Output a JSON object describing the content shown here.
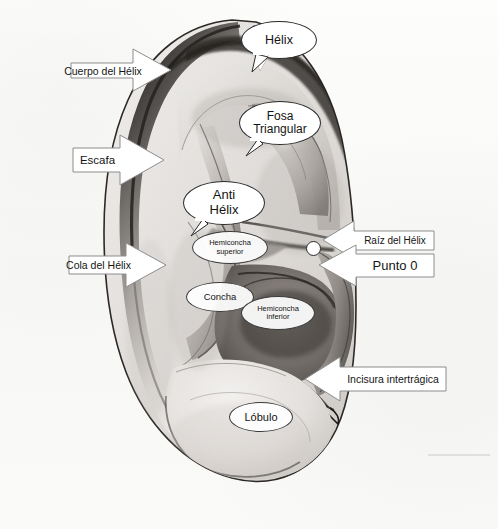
{
  "figure": {
    "background_color": "#fbfbfa",
    "ink_color": "#141414",
    "callout_border_color": "#8d8d8d",
    "bubble_border_color": "#2a2a2a",
    "marker_color": "#ffffff"
  },
  "bubbles": [
    {
      "id": "helix",
      "label": "Hélix"
    },
    {
      "id": "fosa-triangular",
      "label": "Fosa\nTriangular"
    },
    {
      "id": "anti-helix",
      "label": "Anti\nHélix"
    },
    {
      "id": "hemiconcha-superior",
      "label": "Hemiconcha\nsuperior"
    },
    {
      "id": "concha",
      "label": "Concha"
    },
    {
      "id": "hemiconcha-inferior",
      "label": "Hemiconcha\ninferior"
    },
    {
      "id": "lobulo",
      "label": "Lóbulo"
    }
  ],
  "arrows": [
    {
      "id": "cuerpo-del-helix",
      "label": "Cuerpo del Hélix",
      "direction": "right"
    },
    {
      "id": "escafa",
      "label": "Escafa",
      "direction": "right"
    },
    {
      "id": "cola-del-helix",
      "label": "Cola del Hélix",
      "direction": "right"
    },
    {
      "id": "raiz-del-helix",
      "label": "Raíz del Hélix",
      "direction": "left"
    },
    {
      "id": "punto-0",
      "label": "Punto 0",
      "direction": "left"
    },
    {
      "id": "incisura-intertragica",
      "label": "Incisura intertrágica",
      "direction": "left"
    }
  ],
  "markers": [
    {
      "id": "punto-0-dot",
      "label": "Punto 0"
    }
  ]
}
